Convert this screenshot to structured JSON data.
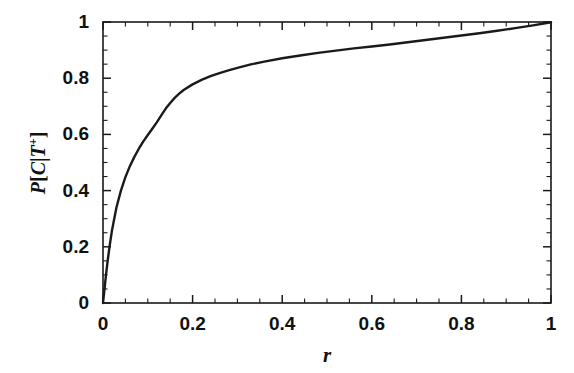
{
  "chart_data": {
    "type": "line",
    "title": "",
    "xlabel": "r",
    "ylabel": "P[C|T+]",
    "ylabel_parts": {
      "prefix": "P",
      "open": "[",
      "numerator": "C",
      "bar": "|",
      "conditional": "T",
      "superscript": "+",
      "close": "]"
    },
    "xlim": [
      0,
      1
    ],
    "ylim": [
      0,
      1
    ],
    "grid": false,
    "legend": null,
    "line_color": "#1a1a1a",
    "line_width": 2.4,
    "axis_color": "#1a1a1a",
    "background": "#ffffff",
    "xticks": [
      0,
      0.2,
      0.4,
      0.6,
      0.8,
      1
    ],
    "xtick_labels": [
      "0",
      "0.2",
      "0.4",
      "0.6",
      "0.8",
      "1"
    ],
    "yticks": [
      0,
      0.2,
      0.4,
      0.6,
      0.8,
      1
    ],
    "ytick_labels": [
      "0",
      "0.2",
      "0.4",
      "0.6",
      "0.8",
      "1"
    ],
    "minor_tick_step": 0.05,
    "x": [
      0.0,
      0.005,
      0.01,
      0.015,
      0.02,
      0.03,
      0.04,
      0.05,
      0.06,
      0.07,
      0.08,
      0.09,
      0.1,
      0.11,
      0.12,
      0.13,
      0.14,
      0.15,
      0.16,
      0.17,
      0.18,
      0.2,
      0.22,
      0.24,
      0.26,
      0.28,
      0.3,
      0.33,
      0.36,
      0.4,
      0.44,
      0.48,
      0.52,
      0.56,
      0.6,
      0.64,
      0.68,
      0.72,
      0.76,
      0.8,
      0.84,
      0.88,
      0.92,
      0.96,
      1.0
    ],
    "y": [
      0.0,
      0.075,
      0.145,
      0.205,
      0.258,
      0.34,
      0.4,
      0.448,
      0.487,
      0.52,
      0.549,
      0.575,
      0.598,
      0.62,
      0.643,
      0.668,
      0.692,
      0.712,
      0.73,
      0.745,
      0.758,
      0.778,
      0.794,
      0.807,
      0.818,
      0.828,
      0.837,
      0.849,
      0.859,
      0.871,
      0.881,
      0.89,
      0.898,
      0.906,
      0.913,
      0.92,
      0.928,
      0.936,
      0.944,
      0.952,
      0.96,
      0.969,
      0.978,
      0.988,
      0.999
    ]
  },
  "axes": {
    "frame": {
      "left": 103,
      "top": 22,
      "right": 551,
      "bottom": 303
    }
  }
}
